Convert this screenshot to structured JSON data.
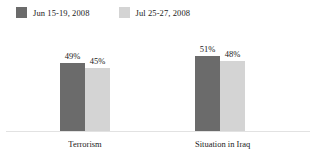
{
  "chart_data": {
    "type": "bar",
    "title": "",
    "xlabel": "",
    "ylabel": "",
    "ylim": [
      0,
      100
    ],
    "grid": false,
    "legend_position": "top-left",
    "value_suffix": "%",
    "categories": [
      "Terrorism",
      "Situation in Iraq"
    ],
    "series": [
      {
        "name": "Jun 15-19, 2008",
        "color": "#6b6b6b",
        "values": [
          49,
          45
        ],
        "labels": [
          "49%",
          "45%"
        ]
      },
      {
        "name": "Jul 25-27, 2008",
        "color": "#d4d4d4",
        "values": [
          45,
          48
        ],
        "labels": [
          "45%",
          "48%"
        ]
      }
    ],
    "bars": [
      {
        "group": 0,
        "series": 0,
        "label": "49%",
        "value": 49,
        "color": "#6b6b6b",
        "height_px": 68
      },
      {
        "group": 0,
        "series": 1,
        "label": "45%",
        "value": 45,
        "color": "#d4d4d4",
        "height_px": 63
      },
      {
        "group": 1,
        "series": 0,
        "label": "51%",
        "value": 51,
        "color": "#6b6b6b",
        "height_px": 75
      },
      {
        "group": 1,
        "series": 1,
        "label": "48%",
        "value": 48,
        "color": "#d4d4d4",
        "height_px": 70
      }
    ]
  },
  "legend": {
    "items": [
      {
        "label": "Jun 15-19, 2008",
        "color": "#6b6b6b"
      },
      {
        "label": "Jul 25-27, 2008",
        "color": "#d4d4d4"
      }
    ]
  },
  "axis": {
    "baseline_color": "#e2e2e2"
  }
}
